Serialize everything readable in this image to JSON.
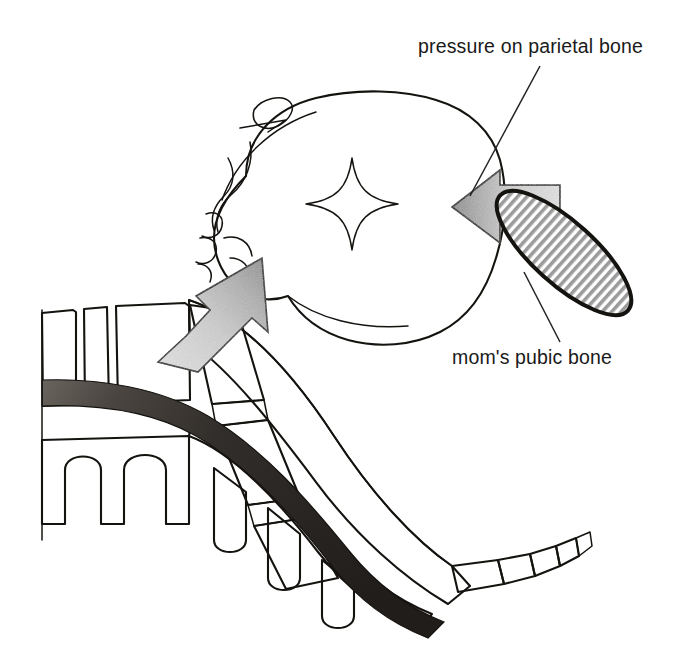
{
  "figure": {
    "kind": "anatomical-line-diagram",
    "background_color": "#ffffff",
    "ink_color": "#15130f"
  },
  "labels": [
    {
      "id": "parietal",
      "text": "pressure on parietal bone",
      "x": 418,
      "y": 53,
      "anchor": "start",
      "leader": {
        "x1": 540,
        "y1": 66,
        "x2": 470,
        "y2": 196
      }
    },
    {
      "id": "pubic",
      "text": "mom's pubic bone",
      "x": 452,
      "y": 364,
      "anchor": "start",
      "leader": {
        "x1": 560,
        "y1": 342,
        "x2": 524,
        "y2": 272
      }
    }
  ],
  "structures": [
    {
      "id": "fetal-head",
      "name": "fetal head in profile",
      "fill": "#ffffff"
    },
    {
      "id": "fontanelle",
      "name": "anterior fontanelle star",
      "fill": "#ffffff"
    },
    {
      "id": "pubic-bone",
      "name": "maternal pubic bone",
      "fill": "#a8a8a8",
      "hatch": "vertical"
    },
    {
      "id": "sacrum",
      "name": "maternal sacrum and coccyx",
      "fill": "#ffffff",
      "hatch": "vertical"
    },
    {
      "id": "spinal-canal",
      "name": "spinal canal shading",
      "fill": "#2f2c29"
    },
    {
      "id": "arrow-right",
      "name": "pressure arrow from pubic bone",
      "direction": "left"
    },
    {
      "id": "arrow-left",
      "name": "pressure arrow from sacrum",
      "direction": "up-right"
    }
  ],
  "colors": {
    "ink": "#15130f",
    "arrow_head": "#9a9a9a",
    "arrow_tail": "#d8d8d8",
    "hatch_gray": "#9b9b9b",
    "canal_dark": "#2b2826",
    "canal_light": "#59544f",
    "text": "#1a1a1a",
    "page": "#ffffff"
  }
}
